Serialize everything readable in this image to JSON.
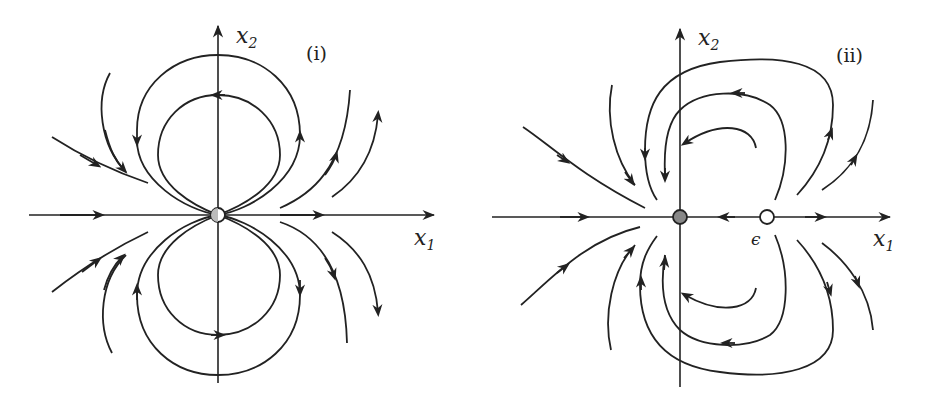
{
  "panels": [
    {
      "id": "i",
      "tag": "(i)",
      "x_axis_label": "x",
      "x_axis_sub": "1",
      "y_axis_label": "x",
      "y_axis_sub": "2",
      "equilibria": [
        {
          "name": "origin",
          "type": "half-filled"
        }
      ]
    },
    {
      "id": "ii",
      "tag": "(ii)",
      "x_axis_label": "x",
      "x_axis_sub": "1",
      "y_axis_label": "x",
      "y_axis_sub": "2",
      "point_label": "ϵ",
      "equilibria": [
        {
          "name": "origin",
          "type": "filled"
        },
        {
          "name": "epsilon",
          "type": "open"
        }
      ]
    }
  ],
  "colors": {
    "ink": "#222222",
    "filled_point": "#888888",
    "background": "#ffffff"
  }
}
